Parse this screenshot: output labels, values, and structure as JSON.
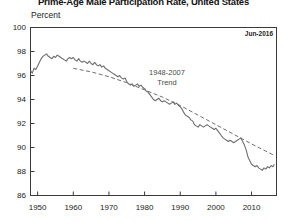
{
  "chart_data": {
    "type": "line",
    "title": "Prime-Age Male Participation Rate, United States",
    "ylabel": "Percent",
    "xlabel": "",
    "ylim": [
      86,
      100
    ],
    "xlim": [
      1948,
      2017
    ],
    "grid": false,
    "legend_position": "none",
    "date_stamp": "Jun-2016",
    "annotation": {
      "line1": "1948-2007",
      "line2": "Trend"
    },
    "ytick_labels": [
      "100",
      "98",
      "96",
      "94",
      "92",
      "90",
      "88",
      "86"
    ],
    "ytick_values": [
      100,
      98,
      96,
      94,
      92,
      90,
      88,
      86
    ],
    "xtick_labels": [
      "1950",
      "1960",
      "1970",
      "1980",
      "1990",
      "2000",
      "2010"
    ],
    "xtick_values": [
      1950,
      1960,
      1970,
      1980,
      1990,
      2000,
      2010
    ],
    "colors": {
      "series_line": "#6e6e6e",
      "trend_line": "#6e6e6e",
      "axis": "#3a3a3a",
      "background": "#ffffff",
      "annotation_text": "#4a4a4a"
    },
    "series": [
      {
        "name": "Prime-Age Male Participation Rate",
        "style": "solid",
        "x": [
          1948.0,
          1948.5,
          1949.0,
          1949.5,
          1950.0,
          1950.5,
          1951.0,
          1951.5,
          1952.0,
          1952.5,
          1953.0,
          1953.5,
          1954.0,
          1954.5,
          1955.0,
          1955.5,
          1956.0,
          1956.5,
          1957.0,
          1957.5,
          1958.0,
          1958.5,
          1959.0,
          1959.5,
          1960.0,
          1960.5,
          1961.0,
          1961.5,
          1962.0,
          1962.5,
          1963.0,
          1963.5,
          1964.0,
          1964.5,
          1965.0,
          1965.5,
          1966.0,
          1966.5,
          1967.0,
          1967.5,
          1968.0,
          1968.5,
          1969.0,
          1969.5,
          1970.0,
          1970.5,
          1971.0,
          1971.5,
          1972.0,
          1972.5,
          1973.0,
          1973.5,
          1974.0,
          1974.5,
          1975.0,
          1975.5,
          1976.0,
          1976.5,
          1977.0,
          1977.5,
          1978.0,
          1978.5,
          1979.0,
          1979.5,
          1980.0,
          1980.5,
          1981.0,
          1981.5,
          1982.0,
          1982.5,
          1983.0,
          1983.5,
          1984.0,
          1984.5,
          1985.0,
          1985.5,
          1986.0,
          1986.5,
          1987.0,
          1987.5,
          1988.0,
          1988.5,
          1989.0,
          1989.5,
          1990.0,
          1990.5,
          1991.0,
          1991.5,
          1992.0,
          1992.5,
          1993.0,
          1993.5,
          1994.0,
          1994.5,
          1995.0,
          1995.5,
          1996.0,
          1996.5,
          1997.0,
          1997.5,
          1998.0,
          1998.5,
          1999.0,
          1999.5,
          2000.0,
          2000.5,
          2001.0,
          2001.5,
          2002.0,
          2002.5,
          2003.0,
          2003.5,
          2004.0,
          2004.5,
          2005.0,
          2005.5,
          2006.0,
          2006.5,
          2007.0,
          2007.5,
          2008.0,
          2008.5,
          2009.0,
          2009.5,
          2010.0,
          2010.5,
          2011.0,
          2011.5,
          2012.0,
          2012.5,
          2013.0,
          2013.5,
          2014.0,
          2014.5,
          2015.0,
          2015.5,
          2016.0,
          2016.4
        ],
        "y": [
          96.4,
          96.2,
          96.6,
          96.5,
          96.8,
          97.1,
          97.4,
          97.6,
          97.7,
          97.8,
          97.6,
          97.5,
          97.4,
          97.6,
          97.5,
          97.7,
          97.6,
          97.5,
          97.4,
          97.3,
          97.2,
          97.4,
          97.5,
          97.4,
          97.5,
          97.3,
          97.2,
          97.4,
          97.2,
          97.1,
          97.2,
          97.1,
          97.0,
          97.2,
          97.0,
          96.9,
          97.1,
          96.9,
          96.8,
          96.9,
          96.7,
          96.8,
          96.6,
          96.5,
          96.4,
          96.3,
          96.2,
          96.1,
          96.0,
          95.9,
          96.0,
          95.8,
          95.7,
          95.8,
          95.5,
          95.3,
          95.2,
          95.3,
          95.1,
          95.2,
          95.3,
          95.1,
          95.2,
          95.0,
          94.9,
          94.7,
          94.6,
          94.4,
          94.2,
          94.0,
          93.9,
          94.0,
          94.1,
          93.9,
          93.8,
          93.9,
          93.8,
          93.7,
          93.6,
          93.7,
          93.8,
          93.6,
          93.7,
          93.5,
          93.4,
          93.2,
          92.9,
          92.7,
          92.6,
          92.5,
          92.3,
          92.2,
          91.9,
          91.8,
          91.7,
          91.9,
          91.8,
          91.7,
          91.8,
          91.9,
          91.8,
          91.7,
          91.6,
          91.5,
          91.6,
          91.4,
          91.2,
          91.0,
          90.8,
          90.7,
          90.6,
          90.5,
          90.6,
          90.5,
          90.4,
          90.5,
          90.6,
          90.7,
          90.8,
          90.5,
          90.2,
          89.8,
          89.2,
          88.9,
          88.6,
          88.5,
          88.4,
          88.5,
          88.3,
          88.2,
          88.1,
          88.3,
          88.2,
          88.4,
          88.3,
          88.5,
          88.4,
          88.6
        ]
      },
      {
        "name": "1948-2007 Trend",
        "style": "dashed",
        "x": [
          1960.0,
          1965.0,
          1970.0,
          1975.0,
          1980.0,
          1985.0,
          1990.0,
          1995.0,
          2000.0,
          2005.0,
          2010.0,
          2016.0
        ],
        "y": [
          96.6,
          96.3,
          95.9,
          95.4,
          94.8,
          94.2,
          93.5,
          92.7,
          91.9,
          91.1,
          90.3,
          89.4
        ]
      }
    ]
  }
}
